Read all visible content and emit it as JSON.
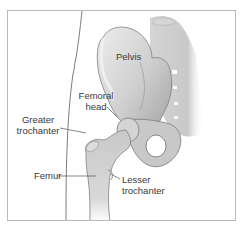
{
  "diagram": {
    "labels": {
      "pelvis": "Pelvis",
      "femoral_head_1": "Femoral",
      "femoral_head_2": "head",
      "greater_trochanter_1": "Greater",
      "greater_trochanter_2": "trochanter",
      "femur": "Femur",
      "lesser_trochanter_1": "Lesser",
      "lesser_trochanter_2": "trochanter"
    },
    "colors": {
      "frame_border": "#b9b9b9",
      "bone_light": "#e4e4e4",
      "bone_mid": "#c4c4c4",
      "bone_dark": "#8e8e8e",
      "label_text": "#3a3a3a",
      "leader_line": "#555555"
    }
  }
}
